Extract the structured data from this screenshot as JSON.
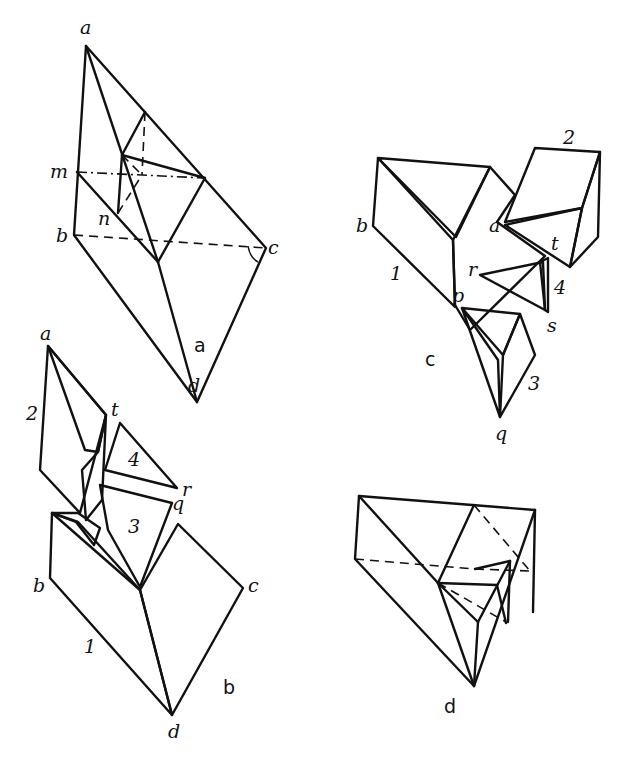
{
  "panels": {
    "a": {
      "caption": "a",
      "labels": {
        "a": "a",
        "m": "m",
        "n": "n",
        "b": "b",
        "c": "c",
        "d": "d"
      }
    },
    "b": {
      "caption": "b",
      "labels": {
        "a": "a",
        "t": "t",
        "2": "2",
        "4": "4",
        "r": "r",
        "q": "q",
        "3": "3",
        "b": "b",
        "c": "c",
        "1": "1",
        "d": "d"
      }
    },
    "c": {
      "caption": "c",
      "labels": {
        "2": "2",
        "b": "b",
        "a": "a",
        "t": "t",
        "1": "1",
        "r": "r",
        "4": "4",
        "p": "p",
        "s": "s",
        "3": "3",
        "q": "q"
      }
    },
    "d": {
      "caption": "d",
      "labels": {}
    }
  }
}
